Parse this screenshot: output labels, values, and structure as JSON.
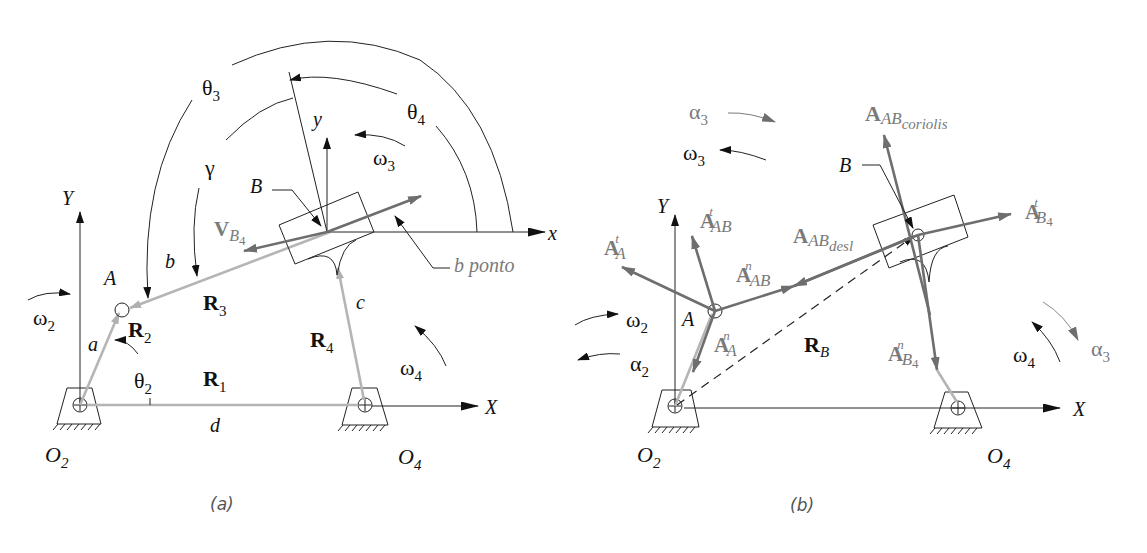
{
  "figure": {
    "panel_a": {
      "caption": "(a)",
      "axes": {
        "X": "X",
        "Y": "Y",
        "x_local": "x",
        "y_local": "y"
      },
      "points": {
        "O2": "O",
        "O2_sub": "2",
        "O4": "O",
        "O4_sub": "4",
        "A": "A",
        "B": "B"
      },
      "links": {
        "a": "a",
        "b": "b",
        "c": "c",
        "d": "d"
      },
      "vectors": {
        "R1": "R",
        "R1_sub": "1",
        "R2": "R",
        "R2_sub": "2",
        "R3": "R",
        "R3_sub": "3",
        "R4": "R",
        "R4_sub": "4",
        "VB4": "V",
        "VB4_sub": "B",
        "VB4_subsub": "4"
      },
      "angles": {
        "theta2": "θ",
        "theta2_sub": "2",
        "theta3": "θ",
        "theta3_sub": "3",
        "theta4": "θ",
        "theta4_sub": "4",
        "gamma": "γ"
      },
      "angular_velocities": {
        "omega2": "ω",
        "omega2_sub": "2",
        "omega3": "ω",
        "omega3_sub": "3",
        "omega4": "ω",
        "omega4_sub": "4"
      },
      "callout": "b ponto"
    },
    "panel_b": {
      "caption": "(b)",
      "axes": {
        "X": "X",
        "Y": "Y"
      },
      "points": {
        "O2": "O",
        "O2_sub": "2",
        "O4": "O",
        "O4_sub": "4",
        "A": "A",
        "B": "B"
      },
      "vectors": {
        "RB": "R",
        "RB_sub": "B",
        "AtA": "A",
        "AtA_sup": "t",
        "AtA_sub": "A",
        "AnA": "A",
        "AnA_sup": "n",
        "AnA_sub": "A",
        "AtAB": "A",
        "AtAB_sup": "t",
        "AtAB_sub": "AB",
        "AnAB": "A",
        "AnAB_sup": "n",
        "AnAB_sub": "AB",
        "AABdesl": "A",
        "AABdesl_sub": "AB",
        "AABdesl_subsub": "desl",
        "AABcor": "A",
        "AABcor_sub": "AB",
        "AABcor_subsub": "coriolis",
        "AtB4": "A",
        "AtB4_sup": "t",
        "AtB4_sub": "B",
        "AtB4_subsub": "4",
        "AnB4": "A",
        "AnB4_sup": "n",
        "AnB4_sub": "B",
        "AnB4_subsub": "4"
      },
      "angular": {
        "omega2": "ω",
        "omega2_sub": "2",
        "alpha2": "α",
        "alpha2_sub": "2",
        "omega3": "ω",
        "omega3_sub": "3",
        "alpha3_top": "α",
        "alpha3_top_sub": "3",
        "omega4": "ω",
        "omega4_sub": "4",
        "alpha3_right": "α",
        "alpha3_right_sub": "3"
      }
    },
    "colors": {
      "ink": "#111111",
      "gray_vector": "#6e6e6e",
      "link_gray": "#b5b5b5",
      "label_gray": "#7a7a7a"
    }
  }
}
